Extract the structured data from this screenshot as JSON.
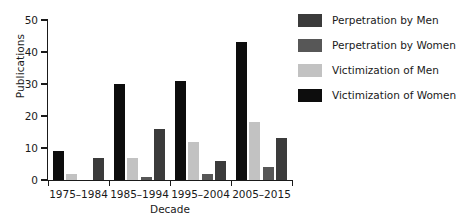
{
  "chart_data": {
    "type": "bar",
    "title": "",
    "xlabel": "Decade",
    "ylabel": "Publications",
    "ylim": [
      0,
      50
    ],
    "yticks": [
      0,
      10,
      20,
      30,
      40,
      50
    ],
    "grid": false,
    "legend_position": "right",
    "categories": [
      "1975–1984",
      "1985–1994",
      "1995–2004",
      "2005–2015"
    ],
    "series": [
      {
        "name": "Victimization of Women",
        "color": "#0d0d0d",
        "values": [
          9,
          30,
          31,
          43
        ]
      },
      {
        "name": "Victimization of Men",
        "color": "#c2c2c2",
        "values": [
          2,
          7,
          12,
          18
        ]
      },
      {
        "name": "Perpetration by Women",
        "color": "#575757",
        "values": [
          0,
          1,
          2,
          4
        ]
      },
      {
        "name": "Perpetration by Men",
        "color": "#3b3b3b",
        "values": [
          7,
          16,
          6,
          13
        ]
      }
    ]
  },
  "legend": {
    "items": [
      {
        "label": "Perpetration by Men",
        "color": "#3b3b3b"
      },
      {
        "label": "Perpetration by Women",
        "color": "#575757"
      },
      {
        "label": "Victimization of Men",
        "color": "#c2c2c2"
      },
      {
        "label": "Victimization of Women",
        "color": "#0d0d0d"
      }
    ]
  },
  "axes": {
    "y_title": "Publications",
    "x_title": "Decade",
    "y_tick_labels": [
      "0",
      "10",
      "20",
      "30",
      "40",
      "50"
    ],
    "x_tick_labels": [
      "1975–1984",
      "1985–1994",
      "1995–2004",
      "2005–2015"
    ]
  }
}
